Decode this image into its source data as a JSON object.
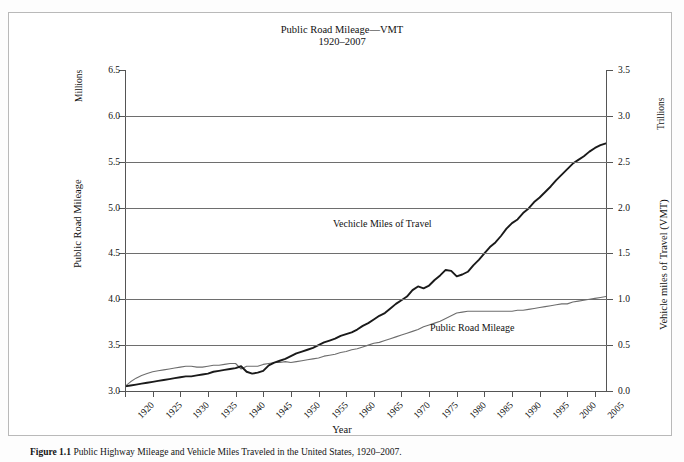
{
  "figure": {
    "caption_number": "Figure 1.1",
    "caption_text": "Public Highway Mileage and Vehicle Miles Traveled in the United States, 1920–2007."
  },
  "chart_data": {
    "type": "line",
    "title": "Public Road Mileage—VMT",
    "subtitle": "1920–2007",
    "xlabel": "Year",
    "grid": true,
    "legend": "inline-labels",
    "xlim": [
      1920,
      2007
    ],
    "x_ticks": [
      "1920",
      "1925",
      "1930",
      "1935",
      "1940",
      "1945",
      "1950",
      "1955",
      "1960",
      "1965",
      "1970",
      "1975",
      "1980",
      "1985",
      "1990",
      "1995",
      "2000",
      "2005"
    ],
    "axes": {
      "left": {
        "label": "Public Road Mileage",
        "unit": "Millions",
        "ylim": [
          3.0,
          6.5
        ],
        "ticks": [
          "6.5",
          "6.0",
          "5.5",
          "5.0",
          "4.5",
          "4.0",
          "3.5",
          "3.0"
        ]
      },
      "right": {
        "label": "Vehicle miles of Travel (VMT)",
        "unit": "Trillions",
        "ylim": [
          0.0,
          3.5
        ],
        "ticks": [
          "3.5",
          "3.0",
          "2.5",
          "2.0",
          "1.5",
          "1.0",
          "0.5",
          "0.0"
        ]
      }
    },
    "series": [
      {
        "name": "Public Road Mileage",
        "axis": "left",
        "unit": "Millions",
        "color": "#6d6d6d",
        "label_text": "Public Road Mileage",
        "x": [
          1920,
          1921,
          1922,
          1923,
          1924,
          1925,
          1926,
          1927,
          1928,
          1929,
          1930,
          1931,
          1932,
          1933,
          1934,
          1935,
          1936,
          1937,
          1938,
          1939,
          1940,
          1941,
          1942,
          1943,
          1944,
          1945,
          1946,
          1947,
          1948,
          1949,
          1950,
          1951,
          1952,
          1953,
          1954,
          1955,
          1956,
          1957,
          1958,
          1959,
          1960,
          1961,
          1962,
          1963,
          1964,
          1965,
          1966,
          1967,
          1968,
          1969,
          1970,
          1971,
          1972,
          1973,
          1974,
          1975,
          1976,
          1977,
          1978,
          1979,
          1980,
          1981,
          1982,
          1983,
          1984,
          1985,
          1986,
          1987,
          1988,
          1989,
          1990,
          1991,
          1992,
          1993,
          1994,
          1995,
          1996,
          1997,
          1998,
          1999,
          2000,
          2001,
          2002,
          2003,
          2004,
          2005,
          2006,
          2007
        ],
        "values": [
          3.05,
          3.1,
          3.14,
          3.17,
          3.19,
          3.21,
          3.22,
          3.23,
          3.24,
          3.25,
          3.26,
          3.27,
          3.27,
          3.26,
          3.26,
          3.27,
          3.28,
          3.28,
          3.29,
          3.3,
          3.3,
          3.24,
          3.27,
          3.27,
          3.27,
          3.29,
          3.3,
          3.31,
          3.31,
          3.32,
          3.31,
          3.32,
          3.33,
          3.34,
          3.35,
          3.36,
          3.38,
          3.39,
          3.4,
          3.42,
          3.43,
          3.45,
          3.46,
          3.48,
          3.5,
          3.52,
          3.53,
          3.55,
          3.57,
          3.59,
          3.61,
          3.63,
          3.65,
          3.67,
          3.7,
          3.72,
          3.74,
          3.76,
          3.79,
          3.82,
          3.85,
          3.86,
          3.87,
          3.87,
          3.87,
          3.87,
          3.87,
          3.87,
          3.87,
          3.87,
          3.87,
          3.88,
          3.88,
          3.89,
          3.9,
          3.91,
          3.92,
          3.93,
          3.94,
          3.95,
          3.95,
          3.97,
          3.98,
          3.99,
          4.0,
          4.01,
          4.02,
          4.03
        ]
      },
      {
        "name": "Vechicle Miles of Travel",
        "axis": "right",
        "unit": "Trillions",
        "color": "#1a1a1a",
        "label_text": "Vechicle Miles of Travel",
        "x": [
          1920,
          1921,
          1922,
          1923,
          1924,
          1925,
          1926,
          1927,
          1928,
          1929,
          1930,
          1931,
          1932,
          1933,
          1934,
          1935,
          1936,
          1937,
          1938,
          1939,
          1940,
          1941,
          1942,
          1943,
          1944,
          1945,
          1946,
          1947,
          1948,
          1949,
          1950,
          1951,
          1952,
          1953,
          1954,
          1955,
          1956,
          1957,
          1958,
          1959,
          1960,
          1961,
          1962,
          1963,
          1964,
          1965,
          1966,
          1967,
          1968,
          1969,
          1970,
          1971,
          1972,
          1973,
          1974,
          1975,
          1976,
          1977,
          1978,
          1979,
          1980,
          1981,
          1982,
          1983,
          1984,
          1985,
          1986,
          1987,
          1988,
          1989,
          1990,
          1991,
          1992,
          1993,
          1994,
          1995,
          1996,
          1997,
          1998,
          1999,
          2000,
          2001,
          2002,
          2003,
          2004,
          2005,
          2006,
          2007
        ],
        "values": [
          0.05,
          0.06,
          0.07,
          0.08,
          0.09,
          0.1,
          0.11,
          0.12,
          0.13,
          0.14,
          0.15,
          0.16,
          0.16,
          0.17,
          0.18,
          0.19,
          0.21,
          0.22,
          0.23,
          0.24,
          0.25,
          0.27,
          0.21,
          0.19,
          0.2,
          0.22,
          0.28,
          0.31,
          0.33,
          0.35,
          0.38,
          0.41,
          0.43,
          0.45,
          0.47,
          0.5,
          0.53,
          0.55,
          0.57,
          0.6,
          0.62,
          0.64,
          0.67,
          0.71,
          0.74,
          0.78,
          0.82,
          0.85,
          0.9,
          0.95,
          0.99,
          1.03,
          1.1,
          1.14,
          1.12,
          1.15,
          1.21,
          1.26,
          1.32,
          1.31,
          1.25,
          1.27,
          1.3,
          1.37,
          1.43,
          1.5,
          1.57,
          1.62,
          1.69,
          1.77,
          1.83,
          1.87,
          1.94,
          1.99,
          2.06,
          2.11,
          2.17,
          2.23,
          2.3,
          2.36,
          2.42,
          2.48,
          2.52,
          2.56,
          2.61,
          2.65,
          2.68,
          2.7
        ]
      }
    ]
  }
}
